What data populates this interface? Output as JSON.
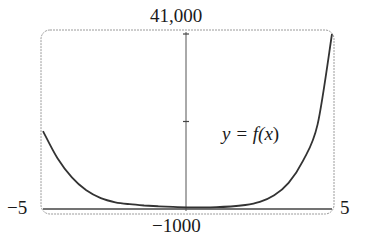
{
  "chart_data": {
    "type": "line",
    "title": "",
    "xlabel": "",
    "ylabel": "",
    "xlim": [
      -5,
      5
    ],
    "ylim": [
      -1000,
      41000
    ],
    "grid": false,
    "legend": null,
    "tick_labels": {
      "x_min": "−5",
      "x_max": "5",
      "y_min": "−1000",
      "y_max": "41,000"
    },
    "y_ticks": [
      20000,
      41000
    ],
    "annotations": [
      {
        "text": "y = f(x)",
        "x": 3.2,
        "y": 11000
      }
    ],
    "series": [
      {
        "name": "y = f(x)",
        "x": [
          -5,
          -4.5,
          -4,
          -3.5,
          -3,
          -2.5,
          -2,
          -1.5,
          -1,
          -0.5,
          0,
          0.5,
          1,
          1.5,
          2,
          2.5,
          3,
          3.5,
          4,
          4.5,
          5
        ],
        "values": [
          17700,
          11200,
          6600,
          3500,
          1600,
          600,
          150,
          -150,
          -350,
          -500,
          -600,
          -600,
          -550,
          -400,
          -50,
          700,
          2300,
          5300,
          10600,
          19300,
          41000
        ]
      }
    ]
  },
  "labels": {
    "y_max": "41,000",
    "y_min": "−1000",
    "x_min": "−5",
    "x_max": "5",
    "curve_prefix": "y = f(",
    "curve_var": "x",
    "curve_suffix": ")"
  },
  "colors": {
    "frame": "#9a9a9a",
    "axes": "#444444",
    "curve": "#333333"
  }
}
